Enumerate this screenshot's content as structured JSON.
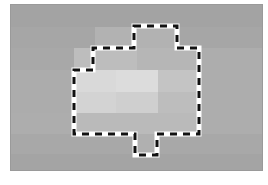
{
  "canvas": {
    "label": "pixelated grayscale image with dashed selection outline",
    "origin": [
      11,
      5
    ],
    "size": [
      251,
      165
    ],
    "base_color": "#a9a9a9"
  },
  "blocks": [
    {
      "x": 0,
      "y": 0,
      "w": 251,
      "h": 22,
      "c": "#a3a3a3"
    },
    {
      "x": 0,
      "y": 22,
      "w": 251,
      "h": 21,
      "c": "#a6a6a6"
    },
    {
      "x": 0,
      "y": 43,
      "w": 251,
      "h": 22,
      "c": "#a8a8a8"
    },
    {
      "x": 0,
      "y": 65,
      "w": 251,
      "h": 43,
      "c": "#acacac"
    },
    {
      "x": 0,
      "y": 108,
      "w": 251,
      "h": 21,
      "c": "#adadad"
    },
    {
      "x": 0,
      "y": 129,
      "w": 251,
      "h": 20,
      "c": "#a8a8a8"
    },
    {
      "x": 0,
      "y": 149,
      "w": 251,
      "h": 16,
      "c": "#a4a4a4"
    },
    {
      "x": 84,
      "y": 22,
      "w": 84,
      "h": 21,
      "c": "#b2b2b2"
    },
    {
      "x": 63,
      "y": 43,
      "w": 63,
      "h": 22,
      "c": "#bdbdbd"
    },
    {
      "x": 126,
      "y": 43,
      "w": 63,
      "h": 22,
      "c": "#b6b6b6"
    },
    {
      "x": 63,
      "y": 65,
      "w": 42,
      "h": 22,
      "c": "#d9d9d9"
    },
    {
      "x": 105,
      "y": 65,
      "w": 42,
      "h": 22,
      "c": "#dcdcdc"
    },
    {
      "x": 147,
      "y": 65,
      "w": 42,
      "h": 22,
      "c": "#c4c4c4"
    },
    {
      "x": 63,
      "y": 87,
      "w": 42,
      "h": 21,
      "c": "#d3d3d3"
    },
    {
      "x": 105,
      "y": 87,
      "w": 42,
      "h": 21,
      "c": "#cfcfcf"
    },
    {
      "x": 147,
      "y": 87,
      "w": 42,
      "h": 21,
      "c": "#bdbdbd"
    },
    {
      "x": 63,
      "y": 108,
      "w": 126,
      "h": 21,
      "c": "#bababa"
    },
    {
      "x": 124,
      "y": 129,
      "w": 22,
      "h": 20,
      "c": "#b0b0b0"
    },
    {
      "x": 189,
      "y": 43,
      "w": 62,
      "h": 65,
      "c": "#adadad"
    }
  ],
  "selection": {
    "name": "dashed-selection-outline",
    "stroke": "#111111",
    "halo": "#ffffff",
    "points": [
      [
        134,
        26
      ],
      [
        177,
        26
      ],
      [
        177,
        48
      ],
      [
        199,
        48
      ],
      [
        199,
        134
      ],
      [
        157,
        134
      ],
      [
        157,
        155
      ],
      [
        135,
        155
      ],
      [
        135,
        134
      ],
      [
        74,
        134
      ],
      [
        74,
        70
      ],
      [
        93,
        70
      ],
      [
        93,
        48
      ],
      [
        134,
        48
      ]
    ]
  }
}
